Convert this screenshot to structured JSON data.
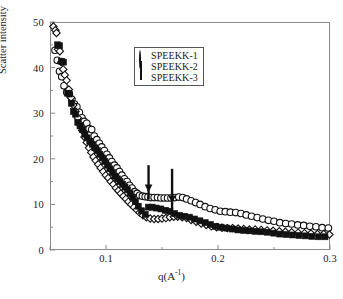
{
  "chart_data": {
    "type": "scatter",
    "title": "",
    "xlabel": "q(A-1)",
    "xlabel_base": "q(A",
    "xlabel_sup": "-1",
    "xlabel_tail": ")",
    "ylabel": "Scatter intensity",
    "xlim": [
      0.05,
      0.3
    ],
    "ylim": [
      0,
      50
    ],
    "xticks": [
      0.1,
      0.2,
      0.3
    ],
    "xtick_labels": [
      "0.1",
      "0.2",
      "0.3"
    ],
    "xminor": [
      0.05,
      0.15,
      0.25
    ],
    "yticks": [
      0,
      10,
      20,
      30,
      40,
      50
    ],
    "ytick_labels": [
      "0",
      "10",
      "20",
      "30",
      "40",
      "50"
    ],
    "yminor": [
      5,
      15,
      25,
      35,
      45
    ],
    "grid": false,
    "legend_position": "upper-center",
    "annotations": [
      {
        "type": "arrow",
        "label": "arrow-1",
        "x": 0.138,
        "y_tip": 12.6,
        "y_tail": 18.6
      },
      {
        "type": "arrow",
        "label": "arrow-2",
        "x": 0.159,
        "y_tip": 10.2,
        "y_tail": 17.8
      }
    ],
    "series": [
      {
        "name": "SPEEKK-1",
        "marker": "circle-open",
        "color": "#111111",
        "points": [
          [
            0.0545,
            43.8
          ],
          [
            0.0565,
            41.6
          ],
          [
            0.0585,
            39.2
          ],
          [
            0.0605,
            38.0
          ],
          [
            0.0625,
            36.0
          ],
          [
            0.065,
            34.6
          ],
          [
            0.0672,
            34.2
          ],
          [
            0.0695,
            33.0
          ],
          [
            0.0718,
            32.0
          ],
          [
            0.074,
            31.4
          ],
          [
            0.0762,
            30.2
          ],
          [
            0.0785,
            29.0
          ],
          [
            0.0805,
            28.2
          ],
          [
            0.0828,
            27.8
          ],
          [
            0.085,
            26.6
          ],
          [
            0.0872,
            26.4
          ],
          [
            0.0895,
            25.0
          ],
          [
            0.0918,
            24.2
          ],
          [
            0.094,
            23.4
          ],
          [
            0.0962,
            22.6
          ],
          [
            0.0985,
            21.8
          ],
          [
            0.1008,
            21.0
          ],
          [
            0.103,
            20.2
          ],
          [
            0.1052,
            19.4
          ],
          [
            0.1075,
            18.6
          ],
          [
            0.1098,
            18.0
          ],
          [
            0.112,
            17.2
          ],
          [
            0.1142,
            16.4
          ],
          [
            0.1165,
            15.6
          ],
          [
            0.1188,
            15.0
          ],
          [
            0.121,
            14.2
          ],
          [
            0.1232,
            13.6
          ],
          [
            0.1255,
            12.8
          ],
          [
            0.1278,
            12.4
          ],
          [
            0.13,
            12.0
          ],
          [
            0.1325,
            11.8
          ],
          [
            0.135,
            11.7
          ],
          [
            0.1375,
            11.6
          ],
          [
            0.14,
            11.5
          ],
          [
            0.143,
            11.5
          ],
          [
            0.146,
            11.5
          ],
          [
            0.149,
            11.4
          ],
          [
            0.152,
            11.4
          ],
          [
            0.155,
            11.4
          ],
          [
            0.158,
            11.4
          ],
          [
            0.1615,
            11.5
          ],
          [
            0.165,
            11.6
          ],
          [
            0.1685,
            11.5
          ],
          [
            0.172,
            11.2
          ],
          [
            0.176,
            10.8
          ],
          [
            0.18,
            10.4
          ],
          [
            0.184,
            10.0
          ],
          [
            0.1885,
            9.5
          ],
          [
            0.193,
            9.1
          ],
          [
            0.1975,
            8.8
          ],
          [
            0.202,
            8.5
          ],
          [
            0.2065,
            8.4
          ],
          [
            0.211,
            8.3
          ],
          [
            0.2158,
            8.2
          ],
          [
            0.2205,
            8.0
          ],
          [
            0.2252,
            7.7
          ],
          [
            0.23,
            7.4
          ],
          [
            0.235,
            7.1
          ],
          [
            0.24,
            6.8
          ],
          [
            0.245,
            6.5
          ],
          [
            0.25,
            6.3
          ],
          [
            0.2552,
            6.0
          ],
          [
            0.2605,
            5.8
          ],
          [
            0.2658,
            5.7
          ],
          [
            0.2712,
            5.5
          ],
          [
            0.2765,
            5.4
          ],
          [
            0.282,
            5.2
          ],
          [
            0.2875,
            5.1
          ],
          [
            0.293,
            4.9
          ],
          [
            0.2985,
            4.8
          ]
        ]
      },
      {
        "name": "SPEEKK-2",
        "marker": "diamond-open",
        "color": "#111111",
        "points": [
          [
            0.053,
            49.0
          ],
          [
            0.0548,
            48.2
          ],
          [
            0.0558,
            47.6
          ],
          [
            0.0572,
            44.0
          ],
          [
            0.0588,
            43.6
          ],
          [
            0.06,
            41.2
          ],
          [
            0.0618,
            39.6
          ],
          [
            0.0632,
            38.4
          ],
          [
            0.0648,
            37.2
          ],
          [
            0.0668,
            35.2
          ],
          [
            0.0688,
            33.4
          ],
          [
            0.0708,
            31.8
          ],
          [
            0.0728,
            30.4
          ],
          [
            0.0748,
            29.0
          ],
          [
            0.0768,
            27.6
          ],
          [
            0.0788,
            26.2
          ],
          [
            0.0808,
            24.8
          ],
          [
            0.0828,
            23.6
          ],
          [
            0.0848,
            22.4
          ],
          [
            0.0868,
            21.4
          ],
          [
            0.0888,
            20.4
          ],
          [
            0.0908,
            19.6
          ],
          [
            0.093,
            18.8
          ],
          [
            0.0952,
            18.0
          ],
          [
            0.0975,
            17.2
          ],
          [
            0.0998,
            16.4
          ],
          [
            0.102,
            15.8
          ],
          [
            0.1042,
            15.0
          ],
          [
            0.1065,
            14.4
          ],
          [
            0.1088,
            13.6
          ],
          [
            0.111,
            13.0
          ],
          [
            0.1132,
            12.4
          ],
          [
            0.1155,
            11.8
          ],
          [
            0.1178,
            11.2
          ],
          [
            0.12,
            10.6
          ],
          [
            0.1225,
            10.0
          ],
          [
            0.125,
            9.4
          ],
          [
            0.1275,
            8.8
          ],
          [
            0.13,
            8.2
          ],
          [
            0.133,
            7.6
          ],
          [
            0.136,
            7.2
          ],
          [
            0.1395,
            6.9
          ],
          [
            0.143,
            6.8
          ],
          [
            0.1465,
            6.8
          ],
          [
            0.15,
            6.9
          ],
          [
            0.1535,
            7.0
          ],
          [
            0.157,
            7.2
          ],
          [
            0.1605,
            7.3
          ],
          [
            0.164,
            7.3
          ],
          [
            0.168,
            7.2
          ],
          [
            0.172,
            7.0
          ],
          [
            0.176,
            6.6
          ],
          [
            0.1805,
            6.2
          ],
          [
            0.185,
            5.8
          ],
          [
            0.1895,
            5.5
          ],
          [
            0.194,
            5.2
          ],
          [
            0.1988,
            5.0
          ],
          [
            0.2035,
            4.9
          ],
          [
            0.2082,
            4.8
          ],
          [
            0.213,
            4.8
          ],
          [
            0.218,
            4.7
          ],
          [
            0.223,
            4.6
          ],
          [
            0.228,
            4.5
          ],
          [
            0.2332,
            4.5
          ],
          [
            0.2385,
            4.4
          ],
          [
            0.2438,
            4.3
          ],
          [
            0.2492,
            4.2
          ],
          [
            0.2548,
            4.1
          ],
          [
            0.2602,
            4.0
          ],
          [
            0.2658,
            3.9
          ],
          [
            0.2715,
            3.8
          ],
          [
            0.2772,
            3.7
          ],
          [
            0.283,
            3.6
          ],
          [
            0.2888,
            3.5
          ],
          [
            0.2945,
            3.5
          ],
          [
            0.2995,
            3.4
          ]
        ]
      },
      {
        "name": "SPEEKK-3",
        "marker": "square-filled",
        "color": "#111111",
        "points": [
          [
            0.0568,
            45.0
          ],
          [
            0.0585,
            44.8
          ],
          [
            0.0602,
            41.4
          ],
          [
            0.062,
            41.2
          ],
          [
            0.0658,
            34.4
          ],
          [
            0.0672,
            34.2
          ],
          [
            0.069,
            32.2
          ],
          [
            0.071,
            30.4
          ],
          [
            0.0728,
            29.8
          ],
          [
            0.0748,
            28.0
          ],
          [
            0.0768,
            27.2
          ],
          [
            0.079,
            26.4
          ],
          [
            0.0812,
            25.4
          ],
          [
            0.0832,
            24.6
          ],
          [
            0.0855,
            23.8
          ],
          [
            0.0878,
            23.2
          ],
          [
            0.09,
            22.4
          ],
          [
            0.0922,
            21.8
          ],
          [
            0.0945,
            21.0
          ],
          [
            0.0968,
            20.2
          ],
          [
            0.099,
            19.4
          ],
          [
            0.1012,
            18.6
          ],
          [
            0.1035,
            17.8
          ],
          [
            0.1058,
            17.0
          ],
          [
            0.108,
            16.2
          ],
          [
            0.1102,
            15.6
          ],
          [
            0.1125,
            15.0
          ],
          [
            0.1148,
            14.4
          ],
          [
            0.117,
            13.8
          ],
          [
            0.1192,
            13.2
          ],
          [
            0.1215,
            12.4
          ],
          [
            0.1238,
            11.6
          ],
          [
            0.1262,
            10.6
          ],
          [
            0.1288,
            9.6
          ],
          [
            0.1318,
            8.6
          ],
          [
            0.135,
            7.8
          ],
          [
            0.1378,
            9.4
          ],
          [
            0.1412,
            9.4
          ],
          [
            0.1448,
            9.2
          ],
          [
            0.149,
            9.0
          ],
          [
            0.153,
            8.7
          ],
          [
            0.157,
            8.5
          ],
          [
            0.1612,
            8.0
          ],
          [
            0.1655,
            7.6
          ],
          [
            0.17,
            7.4
          ],
          [
            0.1745,
            7.2
          ],
          [
            0.179,
            6.8
          ],
          [
            0.1838,
            6.4
          ],
          [
            0.1885,
            6.0
          ],
          [
            0.1932,
            5.6
          ],
          [
            0.198,
            5.2
          ],
          [
            0.2028,
            5.0
          ],
          [
            0.2078,
            4.8
          ],
          [
            0.2128,
            4.6
          ],
          [
            0.2178,
            4.4
          ],
          [
            0.223,
            4.3
          ],
          [
            0.2282,
            4.2
          ],
          [
            0.2335,
            4.1
          ],
          [
            0.2388,
            4.0
          ],
          [
            0.2442,
            3.9
          ],
          [
            0.2498,
            3.7
          ],
          [
            0.2552,
            3.5
          ],
          [
            0.2608,
            3.4
          ],
          [
            0.2665,
            3.3
          ],
          [
            0.2722,
            3.2
          ],
          [
            0.278,
            3.1
          ],
          [
            0.2838,
            3.0
          ],
          [
            0.2898,
            2.9
          ],
          [
            0.2955,
            2.9
          ]
        ]
      }
    ]
  },
  "legend": {
    "items": [
      {
        "label": "SPEEKK-1",
        "marker": "circle-open"
      },
      {
        "label": "SPEEKK-2",
        "marker": "diamond-open"
      },
      {
        "label": "SPEEKK-3",
        "marker": "square-filled"
      }
    ]
  }
}
